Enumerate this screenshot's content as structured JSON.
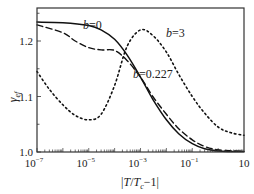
{
  "chart_data": {
    "type": "line",
    "title": "",
    "xlabel": "|T/T_c−1|",
    "ylabel": "γ_ef",
    "xscale": "log",
    "xlim": [
      1e-07,
      10
    ],
    "ylim": [
      1.0,
      1.26
    ],
    "grid": false,
    "legend": "inline annotations",
    "x_ticks": [
      {
        "value": 1e-07,
        "base": "10",
        "exp": "−7"
      },
      {
        "value": 1e-05,
        "base": "10",
        "exp": "−5"
      },
      {
        "value": 0.001,
        "base": "10",
        "exp": "−3"
      },
      {
        "value": 0.1,
        "base": "10",
        "exp": "−1"
      },
      {
        "value": 10,
        "base": "10",
        "exp": ""
      }
    ],
    "y_ticks": [
      "1.0",
      "1.1",
      "1.2"
    ],
    "series": [
      {
        "name": "b=0",
        "style": "solid",
        "x": [
          1e-07,
          1e-06,
          1e-05,
          3e-05,
          0.0001,
          0.0003,
          0.001,
          0.003,
          0.01,
          0.03,
          0.1,
          0.3,
          1,
          10
        ],
        "y": [
          1.234,
          1.233,
          1.228,
          1.22,
          1.203,
          1.175,
          1.135,
          1.095,
          1.058,
          1.033,
          1.015,
          1.006,
          1.002,
          1.001
        ]
      },
      {
        "name": "b=0.227",
        "style": "dashed",
        "x": [
          1e-07,
          1e-06,
          3e-06,
          1e-05,
          3e-05,
          0.0001,
          0.0003,
          0.001,
          0.003,
          0.01,
          0.03,
          0.1,
          0.3,
          1,
          10
        ],
        "y": [
          1.229,
          1.215,
          1.2,
          1.188,
          1.184,
          1.183,
          1.165,
          1.135,
          1.1,
          1.068,
          1.042,
          1.022,
          1.01,
          1.004,
          1.001
        ]
      },
      {
        "name": "b=3",
        "style": "dotted",
        "x": [
          1e-07,
          3e-07,
          1e-06,
          3e-06,
          1e-05,
          3e-05,
          0.0001,
          0.0003,
          0.001,
          0.003,
          0.01,
          0.03,
          0.1,
          0.3,
          1,
          3,
          10
        ],
        "y": [
          1.145,
          1.113,
          1.085,
          1.066,
          1.058,
          1.068,
          1.12,
          1.19,
          1.22,
          1.21,
          1.18,
          1.14,
          1.1,
          1.07,
          1.045,
          1.035,
          1.03
        ]
      }
    ],
    "annotations": [
      {
        "label": "b",
        "value": "=0",
        "series": "b=0"
      },
      {
        "label": "b",
        "value": "=3",
        "series": "b=3"
      },
      {
        "label": "b",
        "value": "=0.227",
        "series": "b=0.227"
      }
    ]
  }
}
